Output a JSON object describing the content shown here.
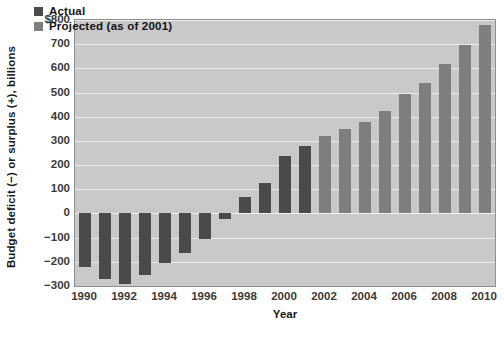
{
  "chart_data": {
    "type": "bar",
    "title": "",
    "xlabel": "Year",
    "ylabel": "Budget deficit (−) or surplus (+), billions",
    "ylim": [
      -300,
      800
    ],
    "xlim": [
      1989.5,
      2010.5
    ],
    "yticks": [
      -300,
      -200,
      -100,
      0,
      100,
      200,
      300,
      400,
      500,
      600,
      700,
      800
    ],
    "ytick_labels": [
      "−300",
      "−200",
      "−100",
      "0",
      "100",
      "200",
      "300",
      "400",
      "500",
      "600",
      "700",
      "$800"
    ],
    "xticks": [
      1990,
      1992,
      1994,
      1996,
      1998,
      2000,
      2002,
      2004,
      2006,
      2008,
      2010
    ],
    "xtick_labels": [
      "1990",
      "1992",
      "1994",
      "1996",
      "1998",
      "2000",
      "2002",
      "2004",
      "2006",
      "2008",
      "2010"
    ],
    "grid": true,
    "legend_position": "top-left",
    "categories": [
      1990,
      1991,
      1992,
      1993,
      1994,
      1995,
      1996,
      1997,
      1998,
      1999,
      2000,
      2001,
      2002,
      2003,
      2004,
      2005,
      2006,
      2007,
      2008,
      2009,
      2010
    ],
    "values": [
      -221,
      -269,
      -290,
      -255,
      -203,
      -164,
      -107,
      -22,
      69,
      125,
      236,
      281,
      320,
      348,
      380,
      422,
      492,
      540,
      617,
      697,
      781
    ],
    "series": [
      {
        "name": "Actual",
        "color": "#4a4a4a",
        "x": [
          1990,
          1991,
          1992,
          1993,
          1994,
          1995,
          1996,
          1997,
          1998,
          1999,
          2000,
          2001
        ],
        "values": [
          -221,
          -269,
          -290,
          -255,
          -203,
          -164,
          -107,
          -22,
          69,
          125,
          236,
          281
        ]
      },
      {
        "name": "Projected (as of 2001)",
        "color": "#7e7e7e",
        "x": [
          2002,
          2003,
          2004,
          2005,
          2006,
          2007,
          2008,
          2009,
          2010
        ],
        "values": [
          320,
          348,
          380,
          422,
          492,
          540,
          617,
          697,
          781
        ]
      }
    ],
    "legend": [
      "Actual",
      "Projected (as of 2001)"
    ]
  },
  "legend": {
    "items": [
      {
        "label": "Actual",
        "swatch": "actual"
      },
      {
        "label": "Projected (as of 2001)",
        "swatch": "projected"
      }
    ]
  },
  "axes": {
    "y_title": "Budget deficit (−) or surplus (+), billions",
    "x_title": "Year"
  },
  "colors": {
    "actual": "#4a4a4a",
    "projected": "#7e7e7e",
    "plot_background": "#c9c9c9",
    "gridline": "#ebebeb",
    "plot_border": "#8e8e8e"
  }
}
